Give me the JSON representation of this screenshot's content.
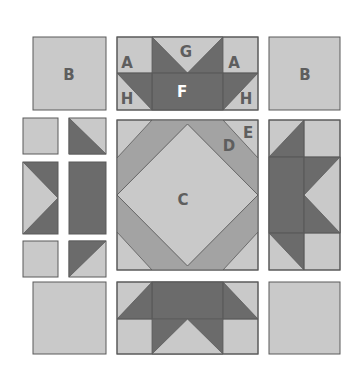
{
  "diagram": {
    "type": "quilt-block-assembly",
    "colors": {
      "light": "#c9c9c9",
      "medium": "#a3a3a3",
      "dark": "#6b6b6b",
      "stroke": "#5a5a5a",
      "label": "#5e5e5e",
      "label_on_dark": "#ffffff"
    },
    "labels": {
      "corner_top_left": "B",
      "corner_top_right": "B",
      "top_unit_left_upper": "A",
      "top_unit_right_upper": "A",
      "top_unit_center_upper": "G",
      "top_unit_center_lower": "F",
      "top_unit_left_lower": "H",
      "top_unit_right_lower": "H",
      "center_square": "C",
      "center_band": "D",
      "center_corner": "E"
    }
  }
}
